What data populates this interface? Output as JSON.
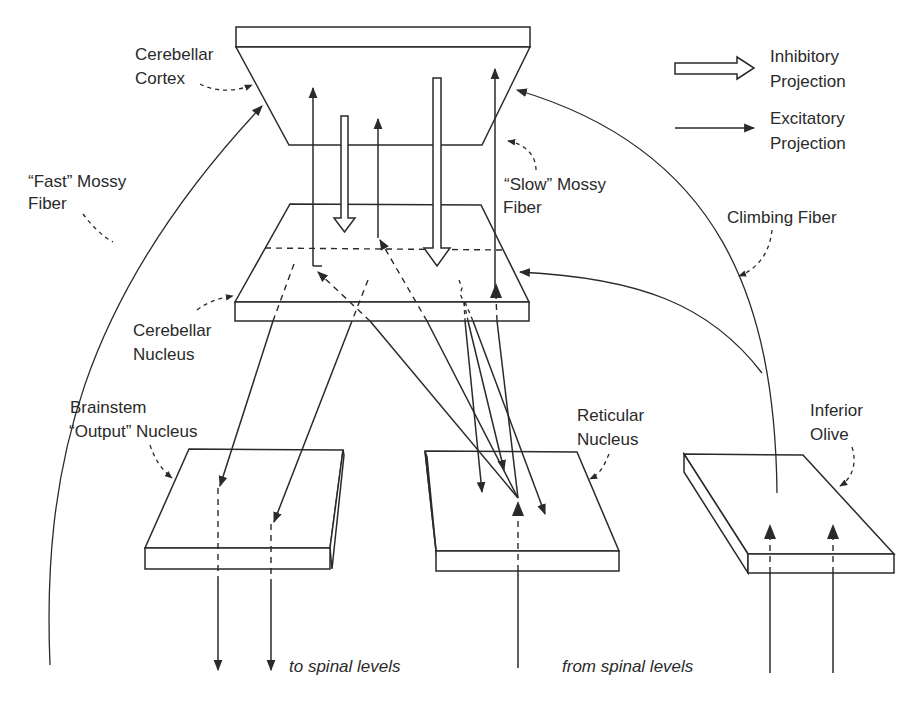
{
  "figure": {
    "type": "schematic"
  },
  "legend": {
    "inhibitory": {
      "line1": "Inhibitory",
      "line2": "Projection",
      "symbol": "hollow-arrow"
    },
    "excitatory": {
      "line1": "Excitatory",
      "line2": "Projection",
      "symbol": "solid-line-arrow"
    }
  },
  "structures": {
    "cerebellar_cortex": {
      "line1": "Cerebellar",
      "line2": "Cortex"
    },
    "cerebellar_nucleus": {
      "line1": "Cerebellar",
      "line2": "Nucleus"
    },
    "brainstem_output_nucleus": {
      "line1": "Brainstem",
      "line2": "“Output” Nucleus"
    },
    "reticular_nucleus": {
      "line1": "Reticular",
      "line2": "Nucleus"
    },
    "inferior_olive": {
      "line1": "Inferior",
      "line2": "Olive"
    }
  },
  "fibers": {
    "fast_mossy": {
      "line1": "“Fast” Mossy",
      "line2": "Fiber"
    },
    "slow_mossy": {
      "line1": "“Slow” Mossy",
      "line2": "Fiber"
    },
    "climbing": {
      "label": "Climbing Fiber"
    }
  },
  "annotations": {
    "to_spinal": "to spinal levels",
    "from_spinal": "from spinal levels"
  },
  "projections": [
    {
      "from": "Cerebellar Cortex",
      "to": "Cerebellar Nucleus",
      "type": "inhibitory",
      "count": 2
    },
    {
      "from": "Cerebellar Nucleus",
      "to": "Cerebellar Cortex",
      "type": "excitatory",
      "count": 3
    },
    {
      "from": "Cerebellar Nucleus",
      "to": "Brainstem Output Nucleus",
      "type": "excitatory",
      "count": 2
    },
    {
      "from": "Cerebellar Nucleus",
      "to": "Reticular Nucleus",
      "type": "excitatory",
      "count": 3
    },
    {
      "from": "Reticular Nucleus",
      "to": "Cerebellar Nucleus / Cortex",
      "type": "excitatory"
    },
    {
      "from": "Brainstem Output Nucleus",
      "to": "spinal levels",
      "type": "excitatory",
      "count": 2
    },
    {
      "from": "spinal levels",
      "to": "Reticular Nucleus",
      "type": "excitatory"
    },
    {
      "from": "spinal levels",
      "to": "Inferior Olive",
      "type": "excitatory",
      "count": 2
    },
    {
      "from": "Inferior Olive",
      "to": "Cerebellar Cortex / Nucleus",
      "type": "excitatory",
      "name": "Climbing Fiber"
    }
  ]
}
